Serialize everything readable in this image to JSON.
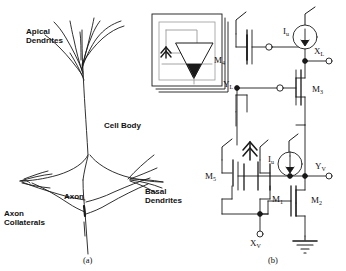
{
  "figure": {
    "background_color": "#ffffff",
    "line_color": "#000000",
    "panels": [
      {
        "id": "a",
        "caption": "(a)",
        "description": "biological pyramidal neuron drawing with inset symbol"
      },
      {
        "id": "b",
        "caption": "(b)",
        "description": "MOS transistor level schematic"
      }
    ]
  },
  "neuron": {
    "labels": {
      "apical_dendrites": "Apical\nDendrites",
      "cell_body": "Cell Body",
      "axon": "Axon",
      "axon_collaterals": "Axon\nCollaterals",
      "basal_dendrites": "Basal\nDendrites"
    },
    "inset": {
      "name": "neuron-symbol-inset",
      "elements": [
        "triangle-amplifier",
        "input-chevron",
        "feedback-loop",
        "stacked-cards"
      ]
    }
  },
  "circuit": {
    "transistors": [
      {
        "name": "M1",
        "label": "M",
        "sub": "1",
        "type": "nmos"
      },
      {
        "name": "M2",
        "label": "M",
        "sub": "2",
        "type": "nmos"
      },
      {
        "name": "M3",
        "label": "M",
        "sub": "3",
        "type": "pmos"
      },
      {
        "name": "M4",
        "label": "M",
        "sub": "4",
        "type": "pmos"
      },
      {
        "name": "M5",
        "label": "M",
        "sub": "5",
        "type": "nmos"
      }
    ],
    "current_sources": [
      {
        "name": "Iu-upper",
        "label": "I",
        "sub": "u",
        "direction": "down"
      },
      {
        "name": "Iu-lower",
        "label": "I",
        "sub": "u",
        "direction": "down"
      }
    ],
    "nodes": [
      {
        "name": "XL",
        "label": "X",
        "sub": "L",
        "kind": "terminal"
      },
      {
        "name": "YL",
        "label": "Y",
        "sub": "L",
        "kind": "internal"
      },
      {
        "name": "XV",
        "label": "X",
        "sub": "V",
        "kind": "terminal"
      },
      {
        "name": "YV",
        "label": "Y",
        "sub": "V",
        "kind": "terminal"
      }
    ],
    "supplies": [
      {
        "name": "vdd-rail",
        "symbol": "slash-rail",
        "count": 5
      },
      {
        "name": "vdd-chevron",
        "symbol": "double-chevron",
        "count": 1
      },
      {
        "name": "ground",
        "symbol": "ground-stack"
      }
    ]
  },
  "captions": {
    "panel_a": "(a)",
    "panel_b": "(b)"
  }
}
